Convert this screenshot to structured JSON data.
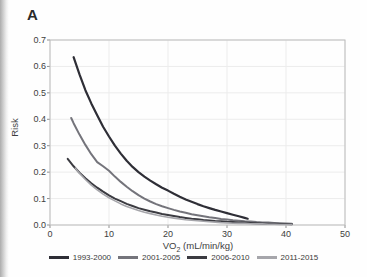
{
  "panel_label": "A",
  "chart_data": {
    "type": "line",
    "title": "",
    "xlabel_main": "VO",
    "xlabel_sub": "2",
    "xlabel_rest": " (mL/min/kg)",
    "ylabel": "Risk",
    "xlim": [
      0,
      50
    ],
    "ylim": [
      0,
      0.7
    ],
    "xticks": [
      "0",
      "10",
      "20",
      "30",
      "40",
      "50"
    ],
    "yticks": [
      "0.0",
      "0.1",
      "0.2",
      "0.3",
      "0.4",
      "0.5",
      "0.6",
      "0.7"
    ],
    "grid": true,
    "legend_position": "bottom",
    "colors": {
      "grid": "#ececec",
      "frame": "#bdbdbd",
      "tick": "#8f8f8f"
    },
    "series": [
      {
        "name": "1993-2000",
        "color": "#2e2e36",
        "width": 2.2,
        "points": [
          [
            4,
            0.635
          ],
          [
            5,
            0.57
          ],
          [
            6,
            0.51
          ],
          [
            7,
            0.46
          ],
          [
            8,
            0.415
          ],
          [
            9,
            0.372
          ],
          [
            10,
            0.335
          ],
          [
            11,
            0.3
          ],
          [
            12,
            0.27
          ],
          [
            13,
            0.243
          ],
          [
            14,
            0.22
          ],
          [
            15,
            0.2
          ],
          [
            16,
            0.183
          ],
          [
            17,
            0.168
          ],
          [
            18,
            0.154
          ],
          [
            19,
            0.141
          ],
          [
            20,
            0.13
          ],
          [
            21,
            0.118
          ],
          [
            22,
            0.107
          ],
          [
            23,
            0.097
          ],
          [
            24,
            0.088
          ],
          [
            25,
            0.079
          ],
          [
            26,
            0.071
          ],
          [
            27,
            0.064
          ],
          [
            28,
            0.057
          ],
          [
            29,
            0.051
          ],
          [
            30,
            0.045
          ],
          [
            31,
            0.039
          ],
          [
            32,
            0.033
          ],
          [
            33,
            0.027
          ],
          [
            33.5,
            0.024
          ]
        ]
      },
      {
        "name": "2001-2005",
        "color": "#74747b",
        "width": 2.0,
        "points": [
          [
            3.6,
            0.405
          ],
          [
            4,
            0.385
          ],
          [
            5,
            0.342
          ],
          [
            6,
            0.303
          ],
          [
            7,
            0.268
          ],
          [
            8,
            0.238
          ],
          [
            9,
            0.222
          ],
          [
            10,
            0.205
          ],
          [
            11,
            0.183
          ],
          [
            12,
            0.163
          ],
          [
            13,
            0.145
          ],
          [
            14,
            0.128
          ],
          [
            15,
            0.113
          ],
          [
            16,
            0.1
          ],
          [
            17,
            0.089
          ],
          [
            18,
            0.079
          ],
          [
            19,
            0.071
          ],
          [
            20,
            0.064
          ],
          [
            21,
            0.057
          ],
          [
            22,
            0.051
          ],
          [
            23,
            0.046
          ],
          [
            24,
            0.041
          ],
          [
            25,
            0.037
          ],
          [
            26,
            0.033
          ],
          [
            27,
            0.029
          ],
          [
            28,
            0.026
          ],
          [
            29,
            0.023
          ],
          [
            30,
            0.021
          ],
          [
            31,
            0.018
          ],
          [
            32,
            0.016
          ],
          [
            33,
            0.014
          ],
          [
            34,
            0.013
          ],
          [
            35,
            0.011
          ],
          [
            36,
            0.01
          ],
          [
            37,
            0.009
          ],
          [
            38,
            0.008
          ],
          [
            39,
            0.007
          ],
          [
            40,
            0.006
          ],
          [
            41,
            0.005
          ]
        ]
      },
      {
        "name": "2006-2010",
        "color": "#3b3b41",
        "width": 2.0,
        "points": [
          [
            3,
            0.25
          ],
          [
            4,
            0.222
          ],
          [
            5,
            0.198
          ],
          [
            6,
            0.177
          ],
          [
            7,
            0.158
          ],
          [
            8,
            0.141
          ],
          [
            9,
            0.126
          ],
          [
            10,
            0.112
          ],
          [
            11,
            0.1
          ],
          [
            12,
            0.09
          ],
          [
            13,
            0.08
          ],
          [
            14,
            0.072
          ],
          [
            15,
            0.064
          ],
          [
            16,
            0.058
          ],
          [
            17,
            0.052
          ],
          [
            18,
            0.047
          ],
          [
            19,
            0.042
          ],
          [
            20,
            0.038
          ],
          [
            21,
            0.034
          ],
          [
            22,
            0.03
          ],
          [
            23,
            0.027
          ],
          [
            24,
            0.024
          ],
          [
            25,
            0.022
          ],
          [
            26,
            0.019
          ],
          [
            27,
            0.017
          ],
          [
            28,
            0.015
          ],
          [
            29,
            0.014
          ],
          [
            30,
            0.012
          ],
          [
            31,
            0.011
          ],
          [
            32,
            0.01
          ],
          [
            33,
            0.009
          ],
          [
            34,
            0.008
          ],
          [
            35,
            0.007
          ],
          [
            36,
            0.006
          ],
          [
            37,
            0.005
          ],
          [
            38,
            0.005
          ],
          [
            39,
            0.004
          ],
          [
            40,
            0.004
          ],
          [
            41,
            0.003
          ]
        ]
      },
      {
        "name": "2011-2015",
        "color": "#a6a6ab",
        "width": 1.6,
        "points": [
          [
            4.3,
            0.215
          ],
          [
            5,
            0.196
          ],
          [
            6,
            0.172
          ],
          [
            7,
            0.151
          ],
          [
            8,
            0.133
          ],
          [
            9,
            0.117
          ],
          [
            10,
            0.103
          ],
          [
            11,
            0.091
          ],
          [
            12,
            0.08
          ],
          [
            13,
            0.07
          ],
          [
            14,
            0.062
          ],
          [
            15,
            0.055
          ],
          [
            16,
            0.048
          ],
          [
            17,
            0.043
          ],
          [
            18,
            0.038
          ],
          [
            19,
            0.033
          ],
          [
            20,
            0.029
          ],
          [
            21,
            0.026
          ],
          [
            22,
            0.023
          ],
          [
            23,
            0.02
          ],
          [
            24,
            0.018
          ],
          [
            25,
            0.016
          ],
          [
            26,
            0.014
          ],
          [
            27,
            0.012
          ],
          [
            28,
            0.011
          ],
          [
            29,
            0.009
          ],
          [
            30,
            0.008
          ],
          [
            31,
            0.007
          ],
          [
            32,
            0.006
          ],
          [
            33,
            0.006
          ],
          [
            34,
            0.005
          ],
          [
            35,
            0.004
          ],
          [
            36,
            0.004
          ],
          [
            37,
            0.003
          ],
          [
            38,
            0.003
          ],
          [
            39,
            0.002
          ],
          [
            40,
            0.002
          ],
          [
            41,
            0.002
          ]
        ]
      }
    ]
  }
}
